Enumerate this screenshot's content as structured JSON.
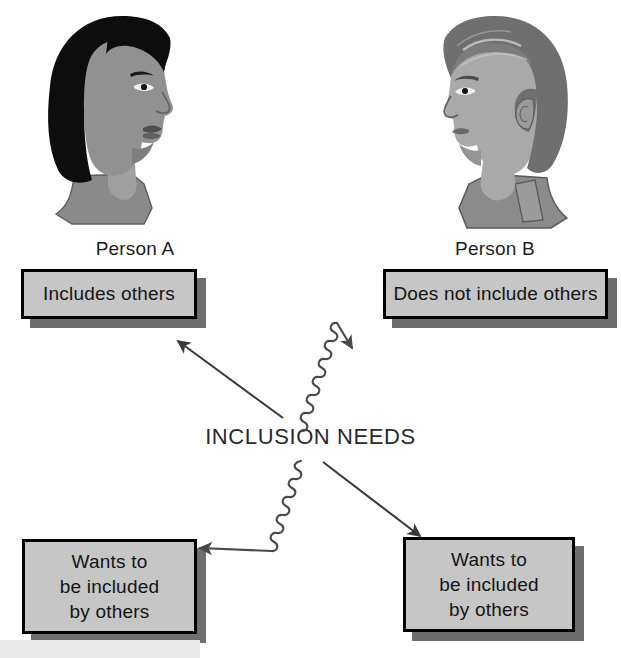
{
  "diagram": {
    "title": "INCLUSION NEEDS",
    "center_label": "INCLUSION NEEDS",
    "background_color": "#ffffff",
    "box_fill_color": "#c6c6c6",
    "box_border_color": "#000000",
    "box_shadow_color": "#6e6e6e",
    "text_color": "#141414",
    "people": [
      {
        "id": "person-a",
        "label": "Person A",
        "icon": "woman-profile-facing-right-icon",
        "hair_color": "#0d0d0d",
        "skin_color": "#8e8e8e",
        "garment_color": "#8a8a8a"
      },
      {
        "id": "person-b",
        "label": "Person B",
        "icon": "man-profile-facing-left-icon",
        "hair_color": "#6f6f6f",
        "skin_color": "#a9a9a9",
        "garment_color": "#8b8b8b"
      }
    ],
    "boxes": [
      {
        "id": "box-includes",
        "owner": "person-a",
        "position": "top-left",
        "lines": [
          "Includes others"
        ]
      },
      {
        "id": "box-not-includes",
        "owner": "person-b",
        "position": "top-right",
        "lines": [
          "Does not include others"
        ]
      },
      {
        "id": "box-wants-left",
        "owner": "person-a",
        "position": "bottom-left",
        "lines": [
          "Wants to",
          "be included",
          "by others"
        ]
      },
      {
        "id": "box-wants-right",
        "owner": "person-b",
        "position": "bottom-right",
        "lines": [
          "Wants to",
          "be included",
          "by others"
        ]
      }
    ],
    "connectors": [
      {
        "id": "arrow-up-left",
        "style": "straight",
        "direction": "up-left",
        "from": "center",
        "to": "box-includes",
        "color": "#3a3a3a"
      },
      {
        "id": "arrow-up-right",
        "style": "wavy",
        "direction": "up-right",
        "from": "center",
        "to": "box-not-includes",
        "color": "#4a4a4a"
      },
      {
        "id": "arrow-down-left",
        "style": "wavy",
        "direction": "down-left",
        "from": "center",
        "to": "box-wants-left",
        "color": "#4a4a4a"
      },
      {
        "id": "arrow-down-right",
        "style": "straight",
        "direction": "down-right",
        "from": "center",
        "to": "box-wants-right",
        "color": "#3a3a3a"
      }
    ]
  }
}
